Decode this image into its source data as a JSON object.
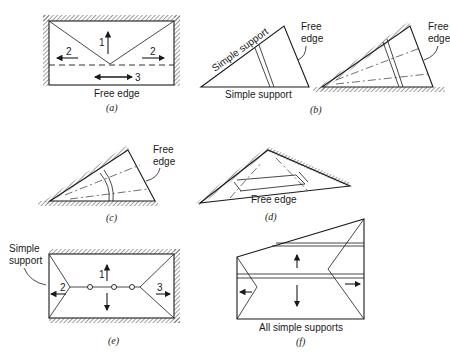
{
  "figure": {
    "panels": [
      {
        "id": "a",
        "caption": "(a)",
        "labels": {
          "bottom": "Free edge"
        },
        "arrows": [
          "1",
          "2",
          "2",
          "3"
        ]
      },
      {
        "id": "b",
        "caption": "(b)",
        "labels": {
          "top_left": "Simple support",
          "bottom": "Simple support",
          "free_1": "Free",
          "free_2": "edge",
          "free_right_1": "Free",
          "free_right_2": "edge"
        }
      },
      {
        "id": "c",
        "caption": "(c)",
        "labels": {
          "free_1": "Free",
          "free_2": "edge"
        }
      },
      {
        "id": "d",
        "caption": "(d)",
        "labels": {
          "bottom": "Free edge"
        }
      },
      {
        "id": "e",
        "caption": "(e)",
        "labels": {
          "support_1": "Simple",
          "support_2": "support"
        },
        "arrows": [
          "1",
          "2",
          "3"
        ]
      },
      {
        "id": "f",
        "caption": "(f)",
        "labels": {
          "bottom": "All simple supports"
        }
      }
    ]
  }
}
